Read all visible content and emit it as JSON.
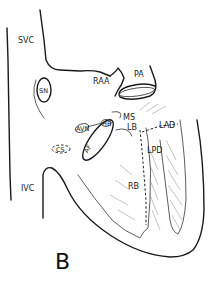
{
  "figure": {
    "panel_label": "B",
    "labels": {
      "svc": "SVC",
      "sn": "SN",
      "raa": "RAA",
      "pa": "PA",
      "avn": "AVN",
      "hb": "HB",
      "af": "AF",
      "ms": "MS",
      "lb": "LB",
      "lad": "LAD",
      "lpd": "LPD",
      "cs": "CS",
      "ivc": "IVC",
      "rb": "RB"
    }
  }
}
